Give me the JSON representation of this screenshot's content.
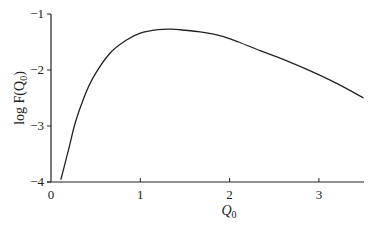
{
  "chart_data": {
    "type": "line",
    "title": "",
    "xlabel": "Q_0",
    "ylabel": "log F(Q_0)",
    "xlim": [
      0,
      3.5
    ],
    "ylim": [
      -4,
      -1
    ],
    "xticks": [
      "0",
      "1",
      "2",
      "3"
    ],
    "yticks": [
      "-1",
      "-2",
      "-3",
      "-4"
    ],
    "grid": false,
    "legend": null,
    "series": [
      {
        "name": "log F(Q_0)",
        "x": [
          0.11,
          0.2,
          0.27,
          0.36,
          0.47,
          0.66,
          0.85,
          1.0,
          1.2,
          1.34,
          1.5,
          1.67,
          1.9,
          2.1,
          2.35,
          2.6,
          2.91,
          3.2,
          3.5
        ],
        "y": [
          -3.96,
          -3.4,
          -2.95,
          -2.53,
          -2.14,
          -1.7,
          -1.46,
          -1.34,
          -1.28,
          -1.27,
          -1.29,
          -1.32,
          -1.39,
          -1.5,
          -1.66,
          -1.81,
          -2.02,
          -2.24,
          -2.5
        ]
      }
    ]
  },
  "labels": {
    "ylabel_main": "log F(Q",
    "ylabel_sub": "0",
    "ylabel_close": ")",
    "xlabel_main": "Q",
    "xlabel_sub": "0"
  }
}
